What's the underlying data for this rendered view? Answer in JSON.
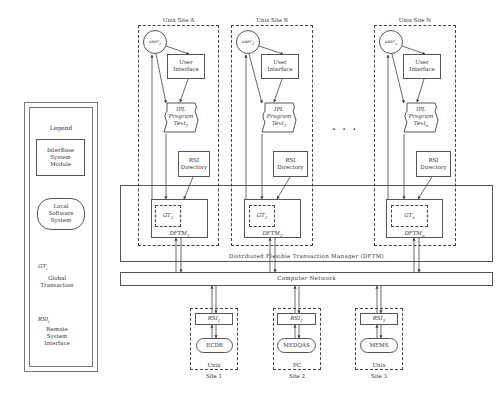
{
  "legend": {
    "title": "Legend",
    "module_box": "InterBase System Module",
    "local_system": "Local Software System",
    "gt_symbol": "GT",
    "gt_sub": "i",
    "gt_desc": "Global Transaction",
    "rsi_symbol": "RSI",
    "rsi_sub": "i",
    "rsi_desc": "Remote System Interface"
  },
  "sites": [
    {
      "title": "Unix Site A",
      "user": "user",
      "user_sub": "1",
      "ui": "User Interface",
      "ipl_title": "IPL",
      "ipl_program": "Program",
      "ipl_text": "Text",
      "ipl_sub": "1",
      "rsi_dir": "RSI Directory",
      "gt": "GT",
      "gt_sub": "1",
      "dftm": "DFTM",
      "dftm_sub": "1"
    },
    {
      "title": "Unix Site B",
      "user": "user",
      "user_sub": "2",
      "ui": "User Interface",
      "ipl_title": "IPL",
      "ipl_program": "Program",
      "ipl_text": "Text",
      "ipl_sub": "2",
      "rsi_dir": "RSI Directory",
      "gt": "GT",
      "gt_sub": "2",
      "dftm": "DFTM",
      "dftm_sub": "2"
    },
    {
      "title": "Unix Site N",
      "user": "user",
      "user_sub": "n",
      "ui": "User Interface",
      "ipl_title": "IPL",
      "ipl_program": "Program",
      "ipl_text": "Text",
      "ipl_sub": "n",
      "rsi_dir": "RSI Directory",
      "gt": "GT",
      "gt_sub": "n",
      "dftm": "DFTM",
      "dftm_sub": "n"
    }
  ],
  "ellipsis": ". . .",
  "dftm_label": "Distributed Flexible Transaction Manager (DFTM)",
  "network_label": "Computer Network",
  "remote_sites": [
    {
      "rsi": "RSI",
      "rsi_sub": "1",
      "system": "ECDB",
      "platform": "Unix",
      "site": "Site 1"
    },
    {
      "rsi": "RSI",
      "rsi_sub": "2",
      "system": "MEDQAS",
      "platform": "PC",
      "site": "Site 2"
    },
    {
      "rsi": "RSI",
      "rsi_sub": "3",
      "system": "MEMS",
      "platform": "Unix",
      "site": "Site 3"
    }
  ]
}
